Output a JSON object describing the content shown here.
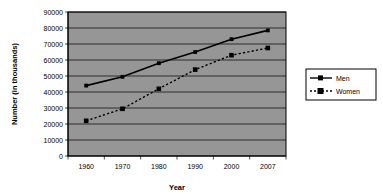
{
  "chart_data": {
    "type": "line",
    "title": "",
    "xlabel": "Year",
    "ylabel": "Number (in thousands)",
    "categories": [
      "1960",
      "1970",
      "1980",
      "1990",
      "2000",
      "2007"
    ],
    "x": [
      1960,
      1970,
      1980,
      1990,
      2000,
      2007
    ],
    "series": [
      {
        "name": "Men",
        "values": [
          44000,
          49500,
          58000,
          65000,
          73000,
          78500
        ],
        "line_style": "solid",
        "marker": "square",
        "color": "#000000"
      },
      {
        "name": "Women",
        "values": [
          22000,
          29500,
          42000,
          54000,
          63000,
          67500
        ],
        "line_style": "dashed",
        "marker": "square",
        "color": "#000000"
      }
    ],
    "ylim": [
      0,
      90000
    ],
    "yticks": [
      "0",
      "10000",
      "20000",
      "30000",
      "40000",
      "50000",
      "60000",
      "70000",
      "80000",
      "90000"
    ],
    "ytick_values": [
      0,
      10000,
      20000,
      30000,
      40000,
      50000,
      60000,
      70000,
      80000,
      90000
    ],
    "xticks": [
      "1960",
      "1970",
      "1980",
      "1990",
      "2000",
      "2007"
    ],
    "grid": "horizontal",
    "legend_position": "right",
    "legend_entries": [
      "Men",
      "Women"
    ],
    "plot_background": "#969696",
    "chart_background": "#ffffff",
    "border_color": "#000000"
  },
  "axes": {
    "y_title": "Number (in thousands)",
    "x_title": "Year"
  },
  "legend": {
    "items": [
      {
        "label": "Men"
      },
      {
        "label": "Women"
      }
    ]
  }
}
